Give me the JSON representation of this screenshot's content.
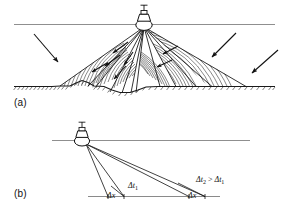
{
  "figure": {
    "background_color": "#ffffff",
    "ink_color": "#111111",
    "surface_line_color": "#8a8a8a",
    "seafloor_color": "#222222",
    "width": 288,
    "height": 218
  },
  "panels": [
    {
      "id": "a",
      "label": "(a)",
      "description": "Survey vessel on the sea surface transmitting two swath beam fans of hatched wavefronts toward an irregular seafloor, with external arrows indicating incoming and outgoing acoustic energy.",
      "elements": {
        "vessel": "survey-vessel",
        "water_surface": "sea-surface-line",
        "seafloor": "seafloor-profile-line",
        "beam_fans": 2,
        "wavefront_arcs": "hatched-arc-wavefronts",
        "propagation_arrows": 6,
        "external_arrows": 4
      }
    },
    {
      "id": "b",
      "label": "(b)",
      "description": "Ray diagram showing two beam pairs from the vessel striking a flat seafloor; the near-nadir pair yields travel-time spread delta-t-1 over footprint delta-x, and the oblique pair yields a larger spread delta-t-2 over the same footprint delta-x.",
      "elements": {
        "vessel": "survey-vessel",
        "water_surface": "sea-surface-line",
        "seafloor": "seafloor-baseline",
        "rays": 4,
        "footprints": 2
      }
    }
  ],
  "annotations": {
    "delta_t1": {
      "symbol": "Δt",
      "subscript": "1",
      "text": "Δt₁"
    },
    "delta_t2_relation": {
      "text": "Δt₂ > Δt₁",
      "left": "Δt₂",
      "operator": ">",
      "right": "Δt₁"
    },
    "delta_x_left": {
      "text": "Δx"
    },
    "delta_x_right": {
      "text": "Δx"
    }
  },
  "panel_a": {
    "label": "(a)"
  },
  "panel_b": {
    "label": "(b)",
    "dt1": "Δt",
    "dt1_sub": "1",
    "dt2": "Δt",
    "dt2_sub": "2",
    "gt": ">",
    "dt1b": "Δt",
    "dt1b_sub": "1",
    "dx_left": "Δx",
    "dx_right": "Δx"
  }
}
